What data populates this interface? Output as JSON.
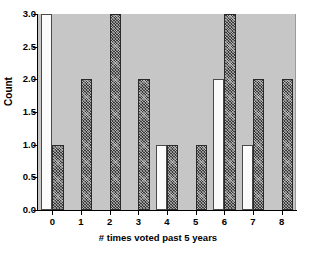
{
  "chart_data": {
    "type": "bar",
    "title": "",
    "subtitle": "",
    "xlabel": "# times voted past 5 years",
    "ylabel": "Count",
    "categories": [
      "0",
      "1",
      "2",
      "3",
      "4",
      "5",
      "6",
      "7",
      "8"
    ],
    "xtick_labels": [
      "0",
      "1",
      "2",
      "3",
      "4",
      "5",
      "6",
      "7",
      "8"
    ],
    "ytick_labels": [
      "0.0",
      "0.5",
      "1.0",
      "1.5",
      "2.0",
      "2.5",
      "3.0"
    ],
    "ytick_values": [
      0.0,
      0.5,
      1.0,
      1.5,
      2.0,
      2.5,
      3.0
    ],
    "ylim": [
      0.0,
      3.0
    ],
    "xlim": [
      -0.5,
      8.5
    ],
    "grid": false,
    "legend": "none",
    "legend_position": "none",
    "grouped": true,
    "series": [
      {
        "name": "open",
        "style": "white-filled",
        "fill_color": "#fbfbfb",
        "edge_color": "#4a4a4a",
        "values": [
          3,
          0,
          0,
          0,
          1,
          0,
          2,
          1,
          0
        ]
      },
      {
        "name": "hatched",
        "style": "dark-crosshatch",
        "fill_color": "#3a3a3a",
        "edge_color": "#2a2a2a",
        "values": [
          1,
          2,
          3,
          2,
          1,
          1,
          3,
          2,
          2
        ]
      }
    ],
    "plot_background": "#c6c6c6",
    "figure_background": "#ffffff",
    "axis_color": "#000000"
  }
}
